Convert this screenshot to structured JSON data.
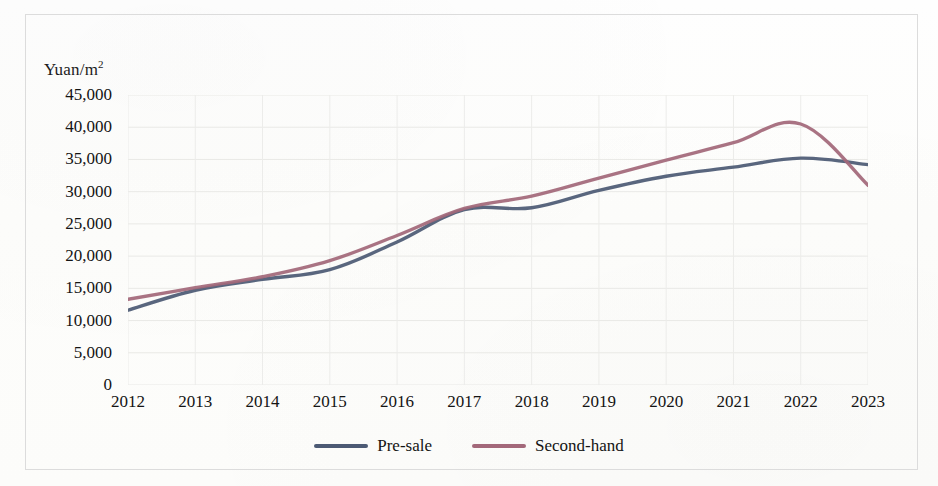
{
  "chart_data": {
    "type": "line",
    "title": "",
    "ylabel": "Yuan/m²",
    "xlabel": "",
    "ylim": [
      0,
      45000
    ],
    "ytick_values": [
      45000,
      40000,
      35000,
      30000,
      25000,
      20000,
      15000,
      10000,
      5000,
      0
    ],
    "ytick_labels": [
      "45,000",
      "40,000",
      "35,000",
      "30,000",
      "25,000",
      "20,000",
      "15,000",
      "10,000",
      "5,000",
      "0"
    ],
    "categories": [
      "2012",
      "2013",
      "2014",
      "2015",
      "2016",
      "2017",
      "2018",
      "2019",
      "2020",
      "2021",
      "2022",
      "2023"
    ],
    "x": [
      2012,
      2013,
      2014,
      2015,
      2016,
      2017,
      2018,
      2019,
      2020,
      2021,
      2022,
      2023
    ],
    "xlim": [
      2012,
      2023
    ],
    "grid": true,
    "legend_position": "bottom-center",
    "series": [
      {
        "name": "Pre-sale",
        "color": "#4c5a74",
        "values": [
          11600,
          14700,
          16400,
          17900,
          22200,
          27200,
          27500,
          30200,
          32400,
          33800,
          35200,
          34200
        ]
      },
      {
        "name": "Second-hand",
        "color": "#a3687a",
        "values": [
          13300,
          15100,
          16800,
          19300,
          23200,
          27400,
          29300,
          32100,
          34900,
          37600,
          40500,
          31000
        ]
      }
    ],
    "annotations": {
      "second_hand_peak_year": 2021.7,
      "second_hand_peak_value": 40800,
      "pre_sale_peak_year": 2022,
      "pre_sale_peak_value": 35200,
      "crossover_year": 2017
    }
  },
  "legend": {
    "items": [
      {
        "label": "Pre-sale",
        "color": "#4c5a74"
      },
      {
        "label": "Second-hand",
        "color": "#a3687a"
      }
    ]
  }
}
